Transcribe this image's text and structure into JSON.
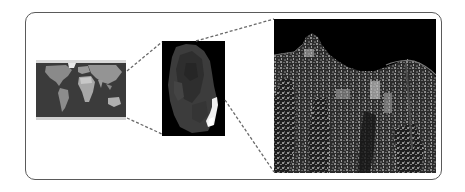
{
  "diagram": {
    "frame": {
      "border_color": "#5a5a5a",
      "corner_radius": 10
    },
    "connector_style": {
      "color": "#6a6a6a",
      "dash": "3,2"
    },
    "panels": [
      {
        "id": "global-map",
        "kind": "world-map",
        "x": 36,
        "y": 60,
        "w": 90,
        "h": 60,
        "background": "#3a3a3a"
      },
      {
        "id": "regional-view",
        "kind": "region-image",
        "x": 162,
        "y": 41,
        "w": 63,
        "h": 95,
        "background": "#000000"
      },
      {
        "id": "satellite-scene",
        "kind": "satellite-image",
        "x": 274,
        "y": 19,
        "w": 162,
        "h": 154,
        "background": "#000000"
      }
    ],
    "connectors": [
      {
        "from": "global-map",
        "to": "regional-view",
        "x1": 127,
        "y1": 71,
        "x2": 162,
        "y2": 42
      },
      {
        "from": "global-map",
        "to": "regional-view",
        "x1": 127,
        "y1": 118,
        "x2": 162,
        "y2": 134
      },
      {
        "from": "regional-view",
        "to": "satellite-scene",
        "x1": 196,
        "y1": 41,
        "x2": 274,
        "y2": 19
      },
      {
        "from": "regional-view",
        "to": "satellite-scene",
        "x1": 225,
        "y1": 100,
        "x2": 274,
        "y2": 172
      }
    ]
  }
}
